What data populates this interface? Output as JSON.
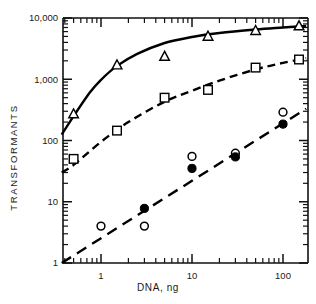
{
  "chart_data": {
    "type": "scatter",
    "title": "",
    "xlabel": "DNA, ng",
    "ylabel": "TRANSFORMANTS",
    "xscale": "log",
    "yscale": "log",
    "xlim": [
      0.37,
      180
    ],
    "ylim": [
      1,
      10000
    ],
    "xticks": [
      1,
      10,
      100
    ],
    "xticklabels": [
      "1",
      "10",
      "100"
    ],
    "yticks": [
      1,
      10,
      100,
      1000,
      10000
    ],
    "yticklabels": [
      "1",
      "10",
      "100",
      "1,000",
      "10,000"
    ],
    "grid": false,
    "legend": "none",
    "minor_ticks": true,
    "series": [
      {
        "name": "triangles",
        "marker": "open-triangle",
        "line": "solid",
        "points": [
          {
            "x": 0.5,
            "y": 270
          },
          {
            "x": 1.5,
            "y": 1700
          },
          {
            "x": 5,
            "y": 2350
          },
          {
            "x": 15,
            "y": 5000
          },
          {
            "x": 50,
            "y": 6200
          },
          {
            "x": 150,
            "y": 7400
          }
        ],
        "fit": [
          {
            "x": 0.37,
            "y": 125
          },
          {
            "x": 0.5,
            "y": 250
          },
          {
            "x": 0.75,
            "y": 600
          },
          {
            "x": 1.0,
            "y": 980
          },
          {
            "x": 1.5,
            "y": 1650
          },
          {
            "x": 2.5,
            "y": 2600
          },
          {
            "x": 5,
            "y": 3900
          },
          {
            "x": 10,
            "y": 4900
          },
          {
            "x": 20,
            "y": 5700
          },
          {
            "x": 50,
            "y": 6500
          },
          {
            "x": 100,
            "y": 7000
          },
          {
            "x": 180,
            "y": 7400
          }
        ]
      },
      {
        "name": "open-squares",
        "marker": "open-square",
        "line": "dashed",
        "points": [
          {
            "x": 0.5,
            "y": 50
          },
          {
            "x": 1.5,
            "y": 145
          },
          {
            "x": 5,
            "y": 500
          },
          {
            "x": 15,
            "y": 670
          },
          {
            "x": 50,
            "y": 1550
          },
          {
            "x": 150,
            "y": 2100
          }
        ],
        "fit": [
          {
            "x": 0.37,
            "y": 30
          },
          {
            "x": 0.5,
            "y": 40
          },
          {
            "x": 1.0,
            "y": 95
          },
          {
            "x": 2.0,
            "y": 200
          },
          {
            "x": 5,
            "y": 430
          },
          {
            "x": 10,
            "y": 650
          },
          {
            "x": 20,
            "y": 950
          },
          {
            "x": 50,
            "y": 1450
          },
          {
            "x": 100,
            "y": 1850
          },
          {
            "x": 180,
            "y": 2200
          }
        ]
      },
      {
        "name": "open-circles",
        "marker": "open-circle",
        "line": "none",
        "points": [
          {
            "x": 1,
            "y": 4
          },
          {
            "x": 3,
            "y": 4
          },
          {
            "x": 10,
            "y": 55
          },
          {
            "x": 30,
            "y": 62
          },
          {
            "x": 100,
            "y": 290
          }
        ]
      },
      {
        "name": "filled-circles",
        "marker": "filled-circle",
        "line": "long-dashed",
        "points": [
          {
            "x": 3,
            "y": 7.8
          },
          {
            "x": 10,
            "y": 35
          },
          {
            "x": 30,
            "y": 54
          },
          {
            "x": 100,
            "y": 185
          }
        ],
        "fit": [
          {
            "x": 0.37,
            "y": 1.0
          },
          {
            "x": 180,
            "y": 330
          }
        ]
      }
    ]
  },
  "axis": {
    "y_title": "TRANSFORMANTS",
    "x_title": "DNA, ng"
  }
}
